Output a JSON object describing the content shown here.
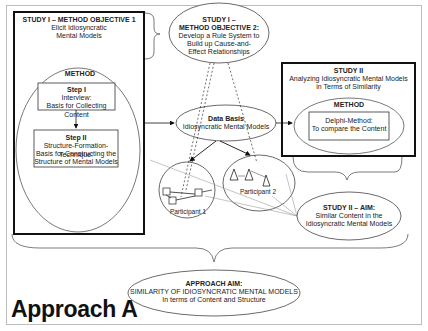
{
  "study1": {
    "title": "STUDY I – METHOD OBJECTIVE 1",
    "subtitle_line1": "Elicit Idiosyncratic",
    "subtitle_line2": "Mental Models",
    "method_label": "METHOD",
    "step1": {
      "title": "Step I",
      "line1": "Interview:",
      "line2": "Basis for Collecting Content"
    },
    "step2": {
      "title": "Step II",
      "line1": "Structure-Formation-Technique:",
      "line2": "Basis for Constructing the",
      "line3": "Structure of Mental Models"
    }
  },
  "objective2": {
    "line1": "STUDY I –",
    "line2": "METHOD OBJECTIVE 2:",
    "line3": "Develop a Rule System to",
    "line4": "Build up Cause-and-",
    "line5": "Effect Relationships"
  },
  "data_basis": {
    "title": "Data Basis",
    "subtitle": "Idiosyncratic Mental Models"
  },
  "study2": {
    "title": "STUDY II",
    "line1": "Analyzing Idiosyncratic Mental Models",
    "line2": "in Terms of Similarity",
    "method_label": "METHOD",
    "box_line1": "Delphi-Method:",
    "box_line2": "To compare the Content"
  },
  "participants": {
    "p1": "Participant 1",
    "p2": "Participant 2"
  },
  "study2_aim": {
    "title": "STUDY II – AIM:",
    "line1": "Similar Content in the",
    "line2": "Idiosyncratic Mental Models"
  },
  "approach_aim": {
    "title": "APPROACH AIM:",
    "line1": "SIMILARITY OF IDIOSYNCRATIC MENTAL MODELS",
    "line2": "In terms of Content and Structure"
  },
  "approach_label": "Approach A"
}
